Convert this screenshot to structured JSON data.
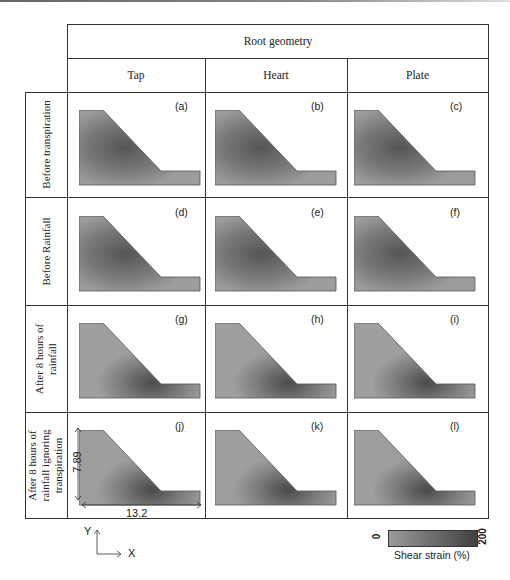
{
  "table": {
    "super_header": "Root geometry",
    "columns": [
      "Tap",
      "Heart",
      "Plate"
    ],
    "rows": [
      {
        "label": "Before transpiration",
        "panels": [
          "(a)",
          "(b)",
          "(c)"
        ]
      },
      {
        "label": "Before Rainfall",
        "panels": [
          "(d)",
          "(e)",
          "(f)"
        ]
      },
      {
        "label": "After 8 hours of\nrainfall",
        "panels": [
          "(g)",
          "(h)",
          "(i)"
        ]
      },
      {
        "label": "After 8 hours of\nrainfall ignoring\ntranspiration",
        "panels": [
          "(j)",
          "(k)",
          "(l)"
        ]
      }
    ]
  },
  "dimensions": {
    "height": "7.89",
    "width": "13.2"
  },
  "axes": {
    "y": "Y",
    "x": "X"
  },
  "colorbar": {
    "min": "0",
    "max": "200",
    "label": "Shear strain (%)",
    "color_low": "#9a9a9a",
    "color_high": "#404040"
  }
}
